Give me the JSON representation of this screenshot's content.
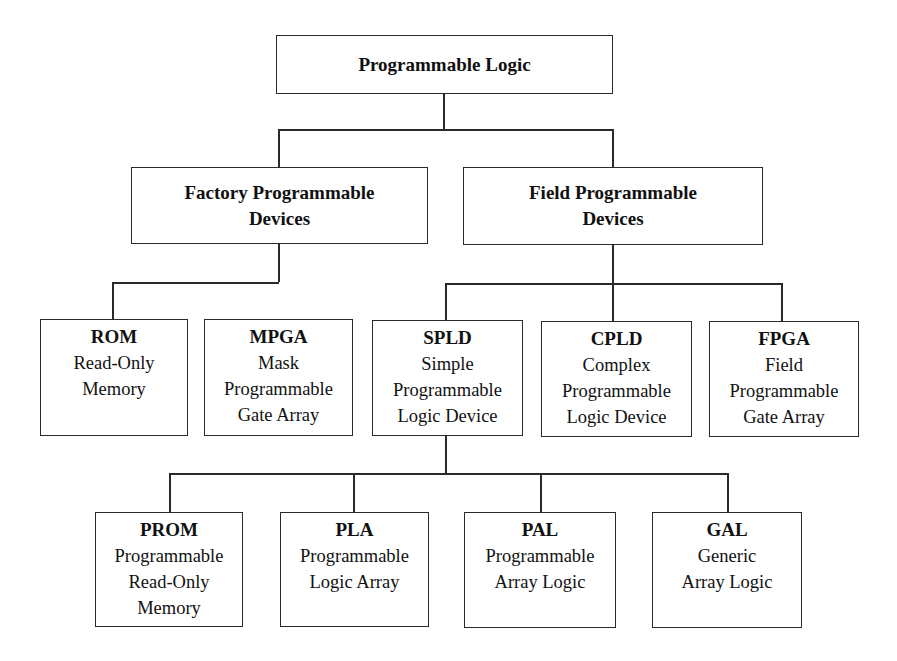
{
  "diagram": {
    "root": {
      "label": "Programmable Logic"
    },
    "level2": [
      {
        "label_line1": "Factory Programmable",
        "label_line2": "Devices"
      },
      {
        "label_line1": "Field Programmable",
        "label_line2": "Devices"
      }
    ],
    "level3": [
      {
        "abbr": "ROM",
        "desc": [
          "Read-Only",
          "Memory"
        ],
        "parent": "Factory Programmable Devices"
      },
      {
        "abbr": "MPGA",
        "desc": [
          "Mask",
          "Programmable",
          "Gate Array"
        ],
        "parent": "Factory Programmable Devices"
      },
      {
        "abbr": "SPLD",
        "desc": [
          "Simple",
          "Programmable",
          "Logic Device"
        ],
        "parent": "Field Programmable Devices"
      },
      {
        "abbr": "CPLD",
        "desc": [
          "Complex",
          "Programmable",
          "Logic Device"
        ],
        "parent": "Field Programmable Devices"
      },
      {
        "abbr": "FPGA",
        "desc": [
          "Field",
          "Programmable",
          "Gate Array"
        ],
        "parent": "Field Programmable Devices"
      }
    ],
    "level4": [
      {
        "abbr": "PROM",
        "desc": [
          "Programmable",
          "Read-Only",
          "Memory"
        ],
        "parent": "SPLD"
      },
      {
        "abbr": "PLA",
        "desc": [
          "Programmable",
          "Logic Array"
        ],
        "parent": "SPLD"
      },
      {
        "abbr": "PAL",
        "desc": [
          "Programmable",
          "Array Logic"
        ],
        "parent": "SPLD"
      },
      {
        "abbr": "GAL",
        "desc": [
          "Generic",
          "Array Logic"
        ],
        "parent": "SPLD"
      }
    ]
  }
}
